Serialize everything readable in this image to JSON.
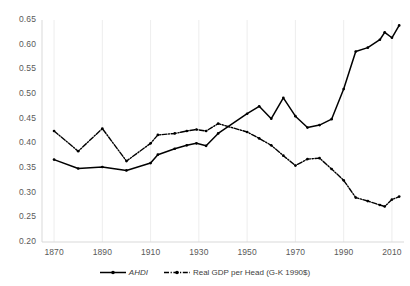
{
  "chart_data": {
    "type": "line",
    "title": "",
    "xlabel": "",
    "ylabel": "",
    "xlim": [
      1865,
      2015
    ],
    "ylim": [
      0.2,
      0.65
    ],
    "ytick_step": 0.05,
    "grid": true,
    "grid_orientation": "vertical",
    "legend_position": "bottom",
    "xticks": [
      "1870",
      "1890",
      "1910",
      "1930",
      "1950",
      "1970",
      "1990",
      "2010"
    ],
    "xtick_values": [
      1870,
      1890,
      1910,
      1930,
      1950,
      1970,
      1990,
      2010
    ],
    "yticks": [
      "0.20",
      "0.25",
      "0.30",
      "0.35",
      "0.40",
      "0.45",
      "0.50",
      "0.55",
      "0.60",
      "0.65"
    ],
    "ytick_values": [
      0.2,
      0.25,
      0.3,
      0.35,
      0.4,
      0.45,
      0.5,
      0.55,
      0.6,
      0.65
    ],
    "x": [
      1870,
      1880,
      1890,
      1900,
      1910,
      1913,
      1920,
      1925,
      1929,
      1933,
      1938,
      1950,
      1955,
      1960,
      1965,
      1970,
      1975,
      1980,
      1985,
      1990,
      1995,
      2000,
      2005,
      2007,
      2010,
      2013
    ],
    "series": [
      {
        "name": "AHDI",
        "style": "solid",
        "color": "#000000",
        "marker": "dot",
        "values": [
          0.367,
          0.349,
          0.352,
          0.345,
          0.36,
          0.377,
          0.389,
          0.396,
          0.4,
          0.395,
          0.42,
          0.46,
          0.475,
          0.45,
          0.492,
          0.455,
          0.432,
          0.437,
          0.449,
          0.51,
          0.586,
          0.594,
          0.61,
          0.625,
          0.614,
          0.639
        ]
      },
      {
        "name": "Real GDP per Head (G-K 1990$)",
        "style": "dash-dot",
        "color": "#000000",
        "marker": "dot",
        "values": [
          0.425,
          0.384,
          0.43,
          0.364,
          0.4,
          0.417,
          0.42,
          0.425,
          0.428,
          0.425,
          0.44,
          0.423,
          0.41,
          0.396,
          0.375,
          0.355,
          0.368,
          0.37,
          0.348,
          0.325,
          0.29,
          0.283,
          0.275,
          0.272,
          0.286,
          0.292
        ]
      }
    ]
  },
  "legend": {
    "items": [
      {
        "label": "AHDI",
        "style": "solid",
        "italic": true
      },
      {
        "label": "Real GDP per Head (G-K 1990$)",
        "style": "dash-dot",
        "italic": false
      }
    ]
  },
  "colors": {
    "line": "#000000",
    "grid": "#e8e8e8",
    "axis": "#d9d9d9",
    "tick_text": "#595959",
    "legend_text": "#404040",
    "background": "#ffffff"
  }
}
